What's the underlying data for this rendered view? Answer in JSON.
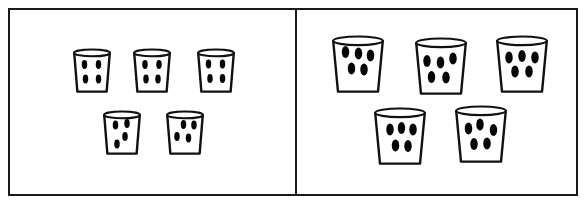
{
  "illustration": {
    "title": "Two groups of cups holding counters",
    "frame": {
      "border_color": "#1a1a1a",
      "background_color": "#ffffff"
    },
    "divider": {
      "color": "#1a1a1a"
    },
    "cup_colors": {
      "fill": "#ffffff",
      "outline": "#111111",
      "counter": "#050505"
    }
  },
  "panels": [
    {
      "id": "left",
      "name": "left-panel",
      "cup_count": 5,
      "counters_per_cup": 4,
      "total_counters": 20,
      "cups": [
        {
          "label": "left-cup-1",
          "counters": 4,
          "x": 73,
          "y": 48,
          "w": 38,
          "h": 45,
          "dots": [
            {
              "cx": 11.5,
              "cy": 16.5
            },
            {
              "cx": 25.5,
              "cy": 16.5
            },
            {
              "cx": 12.5,
              "cy": 31.0
            },
            {
              "cx": 25.5,
              "cy": 31.0
            }
          ]
        },
        {
          "label": "left-cup-2",
          "counters": 4,
          "x": 133,
          "y": 48,
          "w": 38,
          "h": 45,
          "dots": [
            {
              "cx": 12.0,
              "cy": 16.5
            },
            {
              "cx": 26.0,
              "cy": 16.5
            },
            {
              "cx": 13.0,
              "cy": 31.0
            },
            {
              "cx": 25.0,
              "cy": 31.0
            }
          ]
        },
        {
          "label": "left-cup-3",
          "counters": 4,
          "x": 197,
          "y": 48,
          "w": 38,
          "h": 45,
          "dots": [
            {
              "cx": 11.5,
              "cy": 16.0
            },
            {
              "cx": 25.5,
              "cy": 16.0
            },
            {
              "cx": 13.0,
              "cy": 30.5
            },
            {
              "cx": 25.5,
              "cy": 30.5
            }
          ]
        },
        {
          "label": "left-cup-4",
          "counters": 4,
          "x": 103,
          "y": 110,
          "w": 38,
          "h": 45,
          "dots": [
            {
              "cx": 12.5,
              "cy": 15.0
            },
            {
              "cx": 24.0,
              "cy": 13.5
            },
            {
              "cx": 22.0,
              "cy": 26.5
            },
            {
              "cx": 14.0,
              "cy": 34.0
            }
          ]
        },
        {
          "label": "left-cup-5",
          "counters": 4,
          "x": 166,
          "y": 110,
          "w": 38,
          "h": 45,
          "dots": [
            {
              "cx": 17.5,
              "cy": 14.5
            },
            {
              "cx": 28.0,
              "cy": 15.0
            },
            {
              "cx": 11.0,
              "cy": 26.5
            },
            {
              "cx": 22.5,
              "cy": 28.0
            }
          ]
        }
      ]
    },
    {
      "id": "right",
      "name": "right-panel",
      "cup_count": 5,
      "counters_per_cup": 5,
      "total_counters": 25,
      "cups": [
        {
          "label": "right-cup-1",
          "counters": 5,
          "x": 36,
          "y": 35,
          "w": 52,
          "h": 58,
          "dots": [
            {
              "cx": 13.5,
              "cy": 17.0
            },
            {
              "cx": 26.5,
              "cy": 18.5
            },
            {
              "cx": 38.5,
              "cy": 20.5
            },
            {
              "cx": 19.5,
              "cy": 33.5
            },
            {
              "cx": 32.0,
              "cy": 34.5
            }
          ]
        },
        {
          "label": "right-cup-2",
          "counters": 5,
          "x": 119,
          "y": 37,
          "w": 52,
          "h": 58,
          "dots": [
            {
              "cx": 12.0,
              "cy": 24.0
            },
            {
              "cx": 25.5,
              "cy": 25.5
            },
            {
              "cx": 38.0,
              "cy": 21.5
            },
            {
              "cx": 16.5,
              "cy": 40.0
            },
            {
              "cx": 31.0,
              "cy": 40.5
            }
          ]
        },
        {
          "label": "right-cup-3",
          "counters": 5,
          "x": 200,
          "y": 35,
          "w": 52,
          "h": 58,
          "dots": [
            {
              "cx": 13.0,
              "cy": 22.5
            },
            {
              "cx": 26.0,
              "cy": 21.0
            },
            {
              "cx": 39.0,
              "cy": 22.5
            },
            {
              "cx": 19.0,
              "cy": 36.5
            },
            {
              "cx": 33.0,
              "cy": 36.5
            }
          ]
        },
        {
          "label": "right-cup-4",
          "counters": 5,
          "x": 78,
          "y": 107,
          "w": 52,
          "h": 58,
          "dots": [
            {
              "cx": 16.0,
              "cy": 22.5
            },
            {
              "cx": 27.5,
              "cy": 21.0
            },
            {
              "cx": 39.0,
              "cy": 22.5
            },
            {
              "cx": 21.5,
              "cy": 38.5
            },
            {
              "cx": 34.0,
              "cy": 39.0
            }
          ]
        },
        {
          "label": "right-cup-5",
          "counters": 5,
          "x": 159,
          "y": 105,
          "w": 52,
          "h": 58,
          "dots": [
            {
              "cx": 13.5,
              "cy": 23.5
            },
            {
              "cx": 25.0,
              "cy": 19.5
            },
            {
              "cx": 38.5,
              "cy": 25.0
            },
            {
              "cx": 19.0,
              "cy": 39.0
            },
            {
              "cx": 32.0,
              "cy": 38.5
            }
          ]
        }
      ]
    }
  ]
}
